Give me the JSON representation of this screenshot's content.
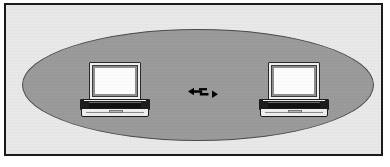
{
  "figure": {
    "caption": "",
    "width": 390,
    "height": 167
  },
  "colors": {
    "page_background": "#ffffff",
    "frame_border": "#1b1b1b",
    "panel_background": "#e9e9e9",
    "coverage_fill": "#9b9b9b",
    "coverage_outline": "#4a4a4a",
    "laptop_screen": "#fdfdfd",
    "laptop_bezel": "#8f8f8f",
    "laptop_body_outline": "#1b1b1b",
    "laptop_keyboard": "#111111",
    "laptop_front": "#efefef",
    "link_arrow": "#000000"
  },
  "diagram": {
    "coverage_area": {
      "name": "wireless-coverage-ellipse",
      "label": "",
      "shape": "ellipse"
    },
    "nodes": [
      {
        "id": "laptop-left",
        "name": "laptop-left",
        "label": "",
        "device_type": "laptop",
        "position": "left"
      },
      {
        "id": "laptop-right",
        "name": "laptop-right",
        "label": "",
        "device_type": "laptop",
        "position": "right"
      }
    ],
    "link": {
      "id": "wireless-link",
      "name": "wireless-link-arrow",
      "label": "",
      "icon": "double-headed-zigzag-arrow",
      "direction": "bidirectional",
      "from": "laptop-left",
      "to": "laptop-right"
    }
  }
}
